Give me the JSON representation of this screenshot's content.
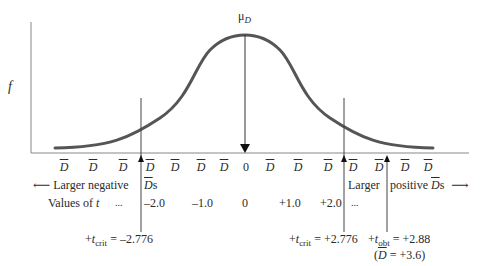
{
  "diagram": {
    "y_axis_label": "f",
    "mean_label": "μ",
    "mean_subscript": "D",
    "x_tick_labels": [
      "D",
      "D",
      "D",
      "D",
      "D",
      "D",
      "D",
      "0",
      "D",
      "D",
      "D",
      "D",
      "D",
      "D",
      "D"
    ],
    "larger_negative_label": "Larger negative",
    "larger_negative_suffix_symbol": "D",
    "larger_negative_suffix": "s",
    "larger_positive_label_1": "Larger",
    "larger_positive_label_2": "positive",
    "larger_positive_suffix_symbol": "D",
    "larger_positive_suffix": "s",
    "arrow_left": "⟵",
    "arrow_right": "⟶",
    "values_of_t_label": "Values of",
    "values_of_t_symbol": "t",
    "t_values": [
      "...",
      "–2.0",
      "–1.0",
      "0",
      "+1.0",
      "+2.0",
      "..."
    ],
    "t_crit_neg": {
      "prefix": "+",
      "symbol": "t",
      "sub": "crit",
      "value": " = –2.776"
    },
    "t_crit_pos": {
      "prefix": "+",
      "symbol": "t",
      "sub": "crit",
      "value": " = +2.776"
    },
    "t_obt": {
      "prefix": "+",
      "symbol": "t",
      "sub": "obt",
      "value": " = +2.88"
    },
    "d_bar_obt": {
      "open": "(",
      "symbol": "D",
      "value": " = +3.6)"
    },
    "colors": {
      "curve": "#555555",
      "axis": "#777777",
      "text": "#2a2a2a"
    }
  }
}
